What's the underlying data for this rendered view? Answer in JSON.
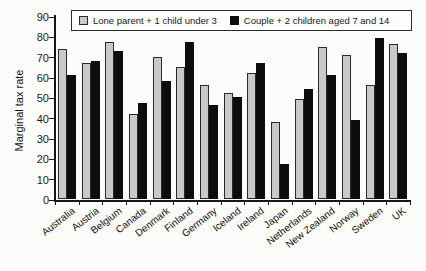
{
  "chart_data": {
    "type": "bar",
    "title": "",
    "xlabel": "",
    "ylabel": "Marginal tax rate",
    "ylim": [
      0,
      90
    ],
    "yticks": [
      0,
      10,
      20,
      30,
      40,
      50,
      60,
      70,
      80,
      90
    ],
    "grid": false,
    "legend_position": "top-inside-border-box",
    "bar_colors": {
      "series1": "#c9c9c9",
      "series2": "#0d0d0d"
    },
    "categories": [
      "Australia",
      "Austria",
      "Belgium",
      "Canada",
      "Denmark",
      "Finland",
      "Germany",
      "Iceland",
      "Ireland",
      "Japan",
      "Netherlands",
      "New Zealand",
      "Norway",
      "Sweden",
      "UK"
    ],
    "series": [
      {
        "name": "Lone parent + 1 child under 3",
        "color": "#c9c9c9",
        "values": [
          74,
          67,
          77,
          42,
          70,
          65,
          56,
          52,
          62,
          38,
          49,
          75,
          71,
          56,
          76
        ]
      },
      {
        "name": "Couple + 2 children aged 7 and 14",
        "color": "#0d0d0d",
        "values": [
          61,
          68,
          73,
          47,
          58,
          77,
          46,
          50,
          67,
          17,
          54,
          61,
          39,
          79,
          72
        ]
      }
    ]
  }
}
